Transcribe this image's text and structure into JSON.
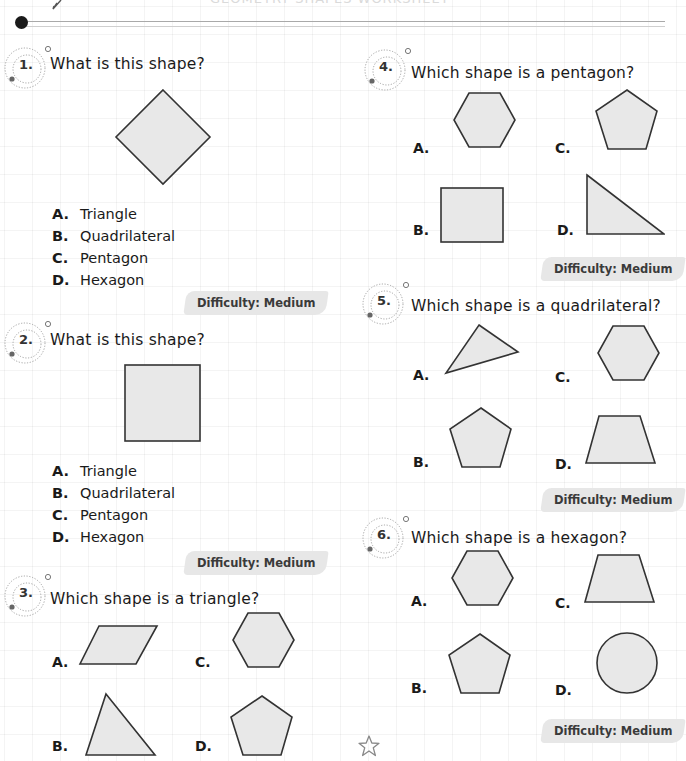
{
  "header": {
    "title_faded": "GEOMETRY SHAPES WORKSHEET",
    "colors": {
      "ink": "#1a1a1a",
      "shape_fill": "#e8e8e8",
      "shape_stroke": "#333333",
      "badge_bg": "#e6e6e6",
      "grid": "#efefef"
    }
  },
  "questions": [
    {
      "number": "1.",
      "text": "What is this shape?",
      "figure": "diamond",
      "options": [
        {
          "letter": "A.",
          "label": "Triangle"
        },
        {
          "letter": "B.",
          "label": "Quadrilateral"
        },
        {
          "letter": "C.",
          "label": "Pentagon"
        },
        {
          "letter": "D.",
          "label": "Hexagon"
        }
      ],
      "difficulty": "Difficulty: Medium"
    },
    {
      "number": "2.",
      "text": "What is this shape?",
      "figure": "square",
      "options": [
        {
          "letter": "A.",
          "label": "Triangle"
        },
        {
          "letter": "B.",
          "label": "Quadrilateral"
        },
        {
          "letter": "C.",
          "label": "Pentagon"
        },
        {
          "letter": "D.",
          "label": "Hexagon"
        }
      ],
      "difficulty": "Difficulty: Medium"
    },
    {
      "number": "3.",
      "text": "Which shape is a triangle?",
      "options": [
        {
          "letter": "A.",
          "shape": "parallelogram"
        },
        {
          "letter": "B.",
          "shape": "triangle"
        },
        {
          "letter": "C.",
          "shape": "hexagon"
        },
        {
          "letter": "D.",
          "shape": "pentagon"
        }
      ]
    },
    {
      "number": "4.",
      "text": "Which shape is a pentagon?",
      "options": [
        {
          "letter": "A.",
          "shape": "hexagon"
        },
        {
          "letter": "B.",
          "shape": "square"
        },
        {
          "letter": "C.",
          "shape": "pentagon"
        },
        {
          "letter": "D.",
          "shape": "right-triangle"
        }
      ],
      "difficulty": "Difficulty: Medium"
    },
    {
      "number": "5.",
      "text": "Which shape is a quadrilateral?",
      "options": [
        {
          "letter": "A.",
          "shape": "triangle"
        },
        {
          "letter": "B.",
          "shape": "pentagon"
        },
        {
          "letter": "C.",
          "shape": "hexagon"
        },
        {
          "letter": "D.",
          "shape": "trapezoid"
        }
      ],
      "difficulty": "Difficulty: Medium"
    },
    {
      "number": "6.",
      "text": "Which shape is a hexagon?",
      "options": [
        {
          "letter": "A.",
          "shape": "hexagon"
        },
        {
          "letter": "B.",
          "shape": "pentagon"
        },
        {
          "letter": "C.",
          "shape": "trapezoid"
        },
        {
          "letter": "D.",
          "shape": "circle"
        }
      ],
      "difficulty": "Difficulty: Medium"
    }
  ]
}
